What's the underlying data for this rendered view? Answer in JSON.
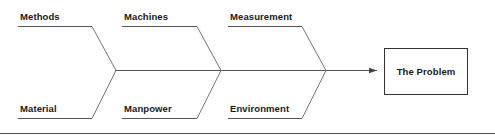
{
  "diagram": {
    "type": "fishbone-ishikawa",
    "effect": {
      "label": "The Problem"
    },
    "categories_top": [
      {
        "label": "Methods"
      },
      {
        "label": "Machines"
      },
      {
        "label": "Measurement"
      }
    ],
    "categories_bottom": [
      {
        "label": "Material"
      },
      {
        "label": "Manpower"
      },
      {
        "label": "Environment"
      }
    ],
    "colors": {
      "line": "#555555",
      "spine": "#555555",
      "box_border": "#333333",
      "box_fill": "#ffffff",
      "text": "#1a1a1a",
      "divider": "#4d4d4d",
      "background": "#ffffff"
    }
  }
}
